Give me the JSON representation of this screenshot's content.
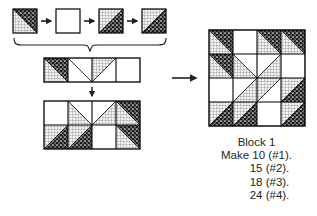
{
  "figure": {
    "caption": {
      "block_label": "Block 1",
      "lines": [
        "Make 10 (#1).",
        "15 (#2).",
        "18 (#3).",
        "24 (#4)."
      ]
    },
    "colors": {
      "ink": "#231f20",
      "outline": "#000000",
      "background": "#ffffff",
      "grid_fabric": "#f0f0f0",
      "dark_fabric": "#1a1a1a"
    },
    "fabrics": [
      {
        "id": "grid",
        "name": "grid-plaid-light-fabric"
      },
      {
        "id": "dot",
        "name": "dark-speckled-fabric"
      },
      {
        "id": "plain",
        "name": "plain-white-fabric"
      }
    ],
    "units_row": {
      "label": "unit-squares-row",
      "connector": "arrow-right",
      "units": [
        {
          "name": "unit-1",
          "kind": "half-square-triangle",
          "diagonal": "anti",
          "upper": "dot",
          "lower": "grid"
        },
        {
          "name": "unit-2",
          "kind": "plain-square",
          "diagonal": "none",
          "upper": "plain",
          "lower": "plain"
        },
        {
          "name": "unit-3",
          "kind": "half-square-triangle",
          "diagonal": "main",
          "upper": "grid",
          "lower": "dot"
        },
        {
          "name": "unit-4",
          "kind": "half-square-triangle",
          "diagonal": "main",
          "upper": "grid",
          "lower": "dot"
        }
      ]
    },
    "brace": {
      "name": "grouping-brace"
    },
    "strip_row": {
      "label": "pieced-strip-row",
      "cells": [
        {
          "name": "strip-cell-1",
          "kind": "half-square-triangle",
          "diagonal": "anti",
          "upper": "dot",
          "lower": "grid"
        },
        {
          "name": "strip-cell-2",
          "kind": "half-square-triangle",
          "diagonal": "anti",
          "upper": "plain",
          "lower": "grid"
        },
        {
          "name": "strip-cell-3",
          "kind": "half-square-triangle",
          "diagonal": "main",
          "upper": "grid",
          "lower": "plain"
        },
        {
          "name": "strip-cell-4",
          "kind": "plain-square",
          "diagonal": "none",
          "upper": "plain",
          "lower": "plain"
        }
      ]
    },
    "down_arrow": {
      "name": "arrow-down"
    },
    "right_arrow": {
      "name": "arrow-right-to-block"
    },
    "assembly": {
      "label": "partial-assembly-grid",
      "rows": 2,
      "cols": 4,
      "cells": [
        {
          "name": "asm-r1c1",
          "kind": "plain-square",
          "diagonal": "none",
          "upper": "plain",
          "lower": "plain"
        },
        {
          "name": "asm-r1c2",
          "kind": "half-square-triangle",
          "diagonal": "anti",
          "upper": "grid",
          "lower": "plain"
        },
        {
          "name": "asm-r1c3",
          "kind": "half-square-triangle",
          "diagonal": "main",
          "upper": "grid",
          "lower": "plain"
        },
        {
          "name": "asm-r1c4",
          "kind": "half-square-triangle",
          "diagonal": "anti",
          "upper": "dot",
          "lower": "grid"
        },
        {
          "name": "asm-r2c1",
          "kind": "half-square-triangle",
          "diagonal": "main",
          "upper": "grid",
          "lower": "dot"
        },
        {
          "name": "asm-r2c2",
          "kind": "half-square-triangle",
          "diagonal": "main",
          "upper": "grid",
          "lower": "dot"
        },
        {
          "name": "asm-r2c3",
          "kind": "plain-square",
          "diagonal": "none",
          "upper": "plain",
          "lower": "plain"
        },
        {
          "name": "asm-r2c4",
          "kind": "half-square-triangle",
          "diagonal": "anti",
          "upper": "dot",
          "lower": "grid"
        }
      ]
    },
    "block": {
      "label": "finished-block-1",
      "rows": 4,
      "cols": 4,
      "cells": [
        {
          "name": "blk-r1c1",
          "kind": "half-square-triangle",
          "diagonal": "anti",
          "upper": "dot",
          "lower": "grid"
        },
        {
          "name": "blk-r1c2",
          "kind": "plain-square",
          "diagonal": "none",
          "upper": "plain",
          "lower": "plain"
        },
        {
          "name": "blk-r1c3",
          "kind": "half-square-triangle",
          "diagonal": "anti",
          "upper": "dot",
          "lower": "grid"
        },
        {
          "name": "blk-r1c4",
          "kind": "half-square-triangle",
          "diagonal": "anti",
          "upper": "dot",
          "lower": "grid"
        },
        {
          "name": "blk-r2c1",
          "kind": "half-square-triangle",
          "diagonal": "anti",
          "upper": "dot",
          "lower": "grid"
        },
        {
          "name": "blk-r2c2",
          "kind": "half-square-triangle",
          "diagonal": "anti",
          "upper": "plain",
          "lower": "grid"
        },
        {
          "name": "blk-r2c3",
          "kind": "half-square-triangle",
          "diagonal": "main",
          "upper": "grid",
          "lower": "plain"
        },
        {
          "name": "blk-r2c4",
          "kind": "plain-square",
          "diagonal": "none",
          "upper": "plain",
          "lower": "plain"
        },
        {
          "name": "blk-r3c1",
          "kind": "plain-square",
          "diagonal": "none",
          "upper": "plain",
          "lower": "plain"
        },
        {
          "name": "blk-r3c2",
          "kind": "half-square-triangle",
          "diagonal": "main",
          "upper": "grid",
          "lower": "plain"
        },
        {
          "name": "blk-r3c3",
          "kind": "half-square-triangle",
          "diagonal": "anti",
          "upper": "plain",
          "lower": "grid"
        },
        {
          "name": "blk-r3c4",
          "kind": "half-square-triangle",
          "diagonal": "main",
          "upper": "grid",
          "lower": "dot"
        },
        {
          "name": "blk-r4c1",
          "kind": "half-square-triangle",
          "diagonal": "main",
          "upper": "grid",
          "lower": "dot"
        },
        {
          "name": "blk-r4c2",
          "kind": "half-square-triangle",
          "diagonal": "main",
          "upper": "grid",
          "lower": "dot"
        },
        {
          "name": "blk-r4c3",
          "kind": "plain-square",
          "diagonal": "none",
          "upper": "plain",
          "lower": "plain"
        },
        {
          "name": "blk-r4c4",
          "kind": "half-square-triangle",
          "diagonal": "main",
          "upper": "grid",
          "lower": "dot"
        }
      ]
    }
  }
}
